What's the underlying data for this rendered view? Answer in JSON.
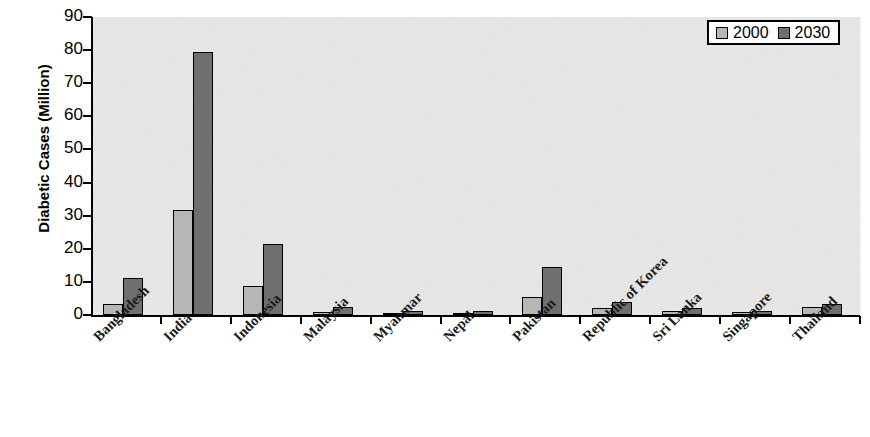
{
  "chart_data": {
    "type": "bar",
    "title": "",
    "xlabel": "",
    "ylabel": "Diabetic Cases (Million)",
    "ylim": [
      0,
      90
    ],
    "y_ticks": [
      0,
      10,
      20,
      30,
      40,
      50,
      60,
      70,
      80,
      90
    ],
    "grid": false,
    "legend_position": "top-right",
    "categories": [
      "Bangladesh",
      "India",
      "Indonesia",
      "Malaysia",
      "Myanmar",
      "Nepal",
      "Pakistan",
      "Republic of Korea",
      "Sri Lanka",
      "Singapore",
      "Thailand"
    ],
    "series": [
      {
        "name": "2000",
        "color": "#b6b6b6",
        "values": [
          3.2,
          31.7,
          8.8,
          0.9,
          0.6,
          0.5,
          5.3,
          2.1,
          1.2,
          0.8,
          2.4
        ]
      },
      {
        "name": "2030",
        "color": "#6f6f6f",
        "values": [
          11.1,
          79.4,
          21.3,
          2.5,
          1.3,
          1.3,
          14.5,
          4.0,
          2.2,
          1.3,
          3.3
        ]
      }
    ]
  },
  "axis": {
    "y_title": "Diabetic Cases (Million)",
    "y_tick_labels": [
      "90",
      "80",
      "70",
      "60",
      "50",
      "40",
      "30",
      "20",
      "10",
      "0"
    ]
  },
  "legend": {
    "items": [
      {
        "label": "2000",
        "swatch": "light-gray-swatch"
      },
      {
        "label": "2030",
        "swatch": "dark-gray-swatch"
      }
    ]
  }
}
